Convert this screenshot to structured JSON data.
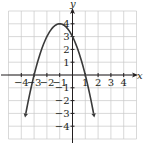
{
  "chart_data": {
    "type": "line",
    "title": "",
    "xlabel": "x",
    "ylabel": "y",
    "xlim": [
      -5,
      5
    ],
    "ylim": [
      -5,
      5
    ],
    "grid": true,
    "x_ticks": [
      -4,
      -3,
      -2,
      -1,
      1,
      2,
      3,
      4
    ],
    "y_ticks": [
      -4,
      -3,
      -2,
      -1,
      1,
      2,
      3,
      4
    ],
    "x_tick_labels": [
      "−4",
      "−3",
      "−2",
      "−1",
      "1",
      "2",
      "3",
      "4"
    ],
    "y_tick_labels": [
      "−4",
      "−3",
      "−2",
      "−1",
      "1",
      "2",
      "3",
      "4"
    ],
    "series": [
      {
        "name": "parabola",
        "equation": "y = -(x+1)^2 + 4",
        "vertex": [
          -1,
          4
        ],
        "x_intercepts": [
          -3,
          1
        ],
        "y_intercept": 3,
        "x": [
          -3.6,
          -3,
          -2.5,
          -2,
          -1.5,
          -1,
          -0.5,
          0,
          0.5,
          1,
          1.6
        ],
        "values": [
          -2.76,
          0,
          1.75,
          3,
          3.75,
          4,
          3.75,
          3,
          1.75,
          0,
          -2.76
        ],
        "end_arrows": true,
        "color": "#3a3a3a"
      }
    ]
  },
  "axes": {
    "x_label": "x",
    "y_label": "y"
  },
  "colors": {
    "grid": "#c8c8c8",
    "axis": "#231f20",
    "curve": "#3a3a3a"
  }
}
